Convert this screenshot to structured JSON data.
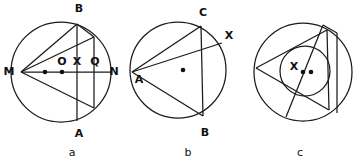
{
  "figure": {
    "background_color": "#ffffff",
    "stroke_color": "#1a1a1a",
    "panels": [
      {
        "id": "a",
        "caption": "a",
        "description": "Circle with diameter MN, vertical chord AB, a second vertical chord, and chords drawn from M",
        "labels": [
          {
            "name": "B",
            "text": "B",
            "x": 79,
            "y": 9
          },
          {
            "name": "M",
            "text": "M",
            "x": 9,
            "y": 72
          },
          {
            "name": "O",
            "text": "O",
            "x": 62,
            "y": 62
          },
          {
            "name": "X",
            "text": "X",
            "x": 77,
            "y": 62
          },
          {
            "name": "Q",
            "text": "Q",
            "x": 95,
            "y": 62
          },
          {
            "name": "N",
            "text": "N",
            "x": 113,
            "y": 72
          },
          {
            "name": "A",
            "text": "A",
            "x": 79,
            "y": 134
          }
        ],
        "points": [
          {
            "name": "center-dot",
            "x": 45,
            "y": 72
          },
          {
            "name": "midpoint-dot",
            "x": 62,
            "y": 72
          }
        ]
      },
      {
        "id": "b",
        "caption": "b",
        "description": "Circle with inscribed triangle ABC and a chord from A to point X on the circle",
        "labels": [
          {
            "name": "C",
            "text": "C",
            "x": 203,
            "y": 13
          },
          {
            "name": "X",
            "text": "X",
            "x": 228,
            "y": 36
          },
          {
            "name": "A",
            "text": "A",
            "x": 140,
            "y": 79
          },
          {
            "name": "B",
            "text": "B",
            "x": 205,
            "y": 134
          }
        ],
        "points": [
          {
            "name": "center-dot",
            "x": 183,
            "y": 70
          }
        ]
      },
      {
        "id": "c",
        "caption": "c",
        "description": "Circle with inscribed triangle, an inner circle, a vertical chord and a diagonal chord",
        "labels": [
          {
            "name": "X",
            "text": "X",
            "x": 294,
            "y": 68
          }
        ],
        "points": [
          {
            "name": "incenter-dot",
            "x": 303,
            "y": 72
          },
          {
            "name": "center-dot",
            "x": 311,
            "y": 72
          }
        ]
      }
    ],
    "captions": [
      {
        "name": "caption-a",
        "text": "a",
        "x": 72,
        "y": 153
      },
      {
        "name": "caption-b",
        "text": "b",
        "x": 188,
        "y": 153
      },
      {
        "name": "caption-c",
        "text": "c",
        "x": 300,
        "y": 153
      }
    ]
  }
}
